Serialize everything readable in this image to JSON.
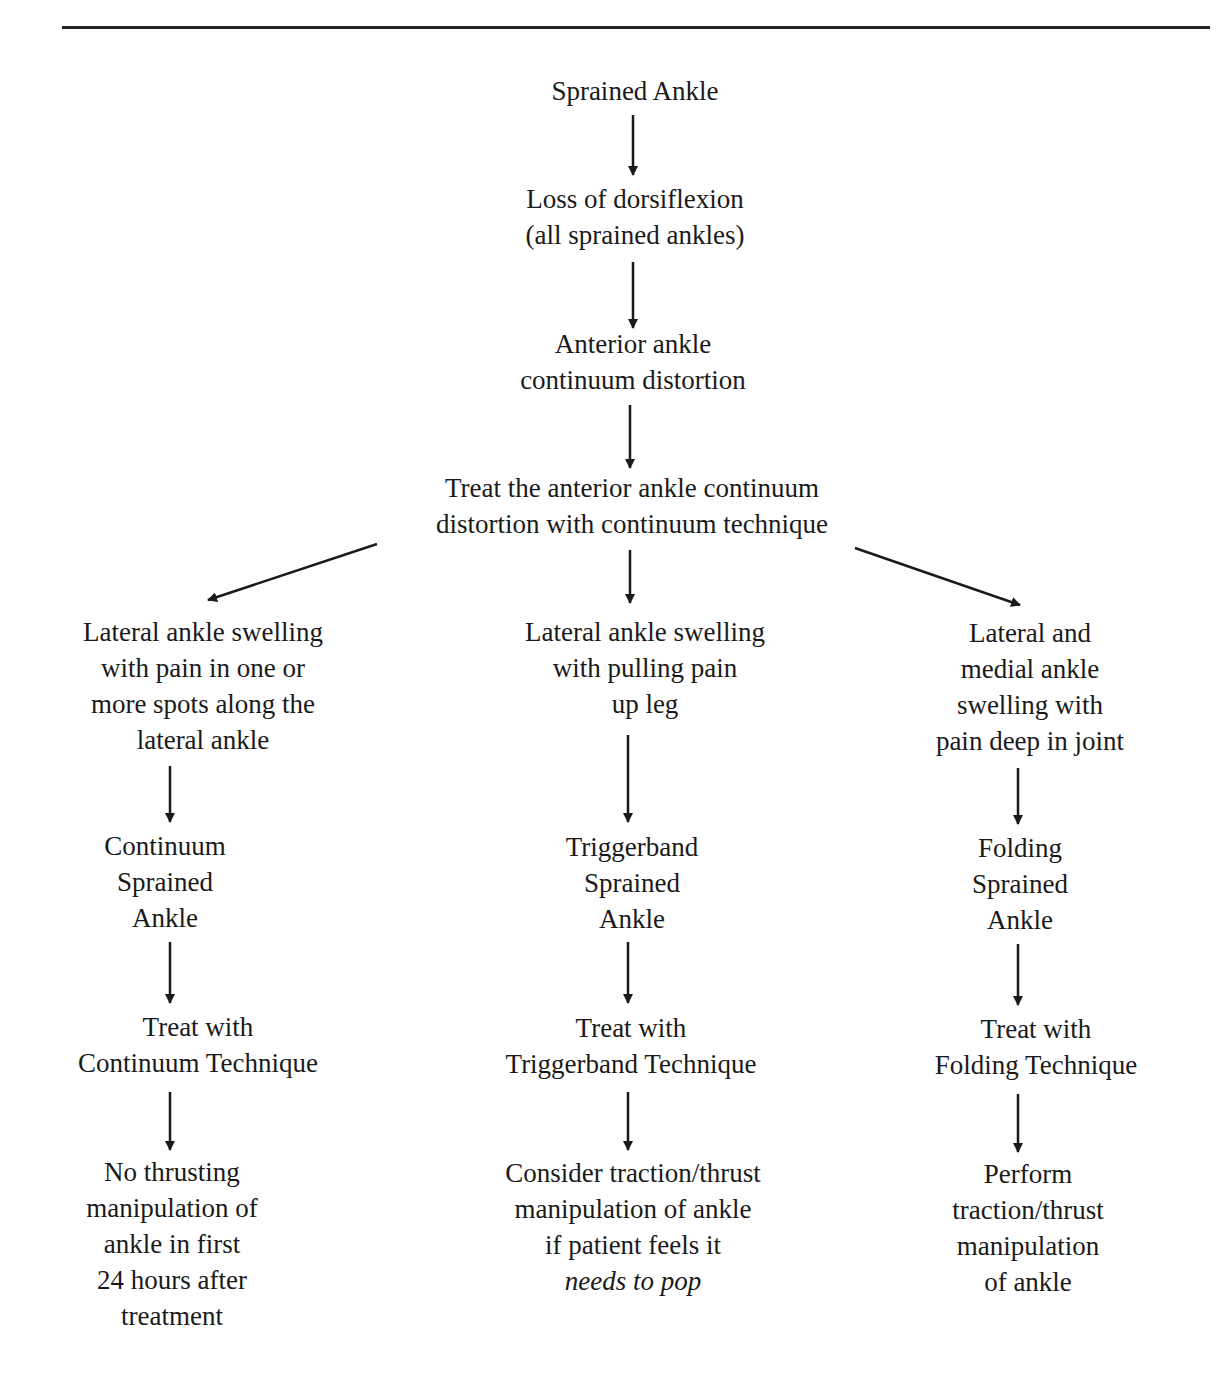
{
  "diagram": {
    "type": "flowchart",
    "root": {
      "lines": [
        "Sprained Ankle"
      ]
    },
    "step2": {
      "lines": [
        "Loss of dorsiflexion",
        "(all sprained ankles)"
      ]
    },
    "step3": {
      "lines": [
        "Anterior ankle",
        "continuum distortion"
      ]
    },
    "step4": {
      "lines": [
        "Treat the anterior ankle continuum",
        "distortion with continuum technique"
      ]
    },
    "branches": [
      {
        "symptom": {
          "lines": [
            "Lateral ankle swelling",
            "with pain in one or",
            "more spots along the",
            "lateral ankle"
          ]
        },
        "diagnosis": {
          "lines": [
            "Continuum",
            "Sprained",
            "Ankle"
          ]
        },
        "treatment": {
          "lines": [
            "Treat with",
            "Continuum Technique"
          ]
        },
        "outcome": {
          "lines": [
            "No thrusting",
            "manipulation of",
            "ankle in first",
            "24 hours after",
            "treatment"
          ]
        }
      },
      {
        "symptom": {
          "lines": [
            "Lateral ankle swelling",
            "with pulling pain",
            "up leg"
          ]
        },
        "diagnosis": {
          "lines": [
            "Triggerband",
            "Sprained",
            "Ankle"
          ]
        },
        "treatment": {
          "lines": [
            "Treat with",
            "Triggerband Technique"
          ]
        },
        "outcome": {
          "lines": [
            "Consider traction/thrust",
            "manipulation of ankle",
            "if patient feels it",
            "needs to pop"
          ]
        }
      },
      {
        "symptom": {
          "lines": [
            "Lateral and",
            "medial ankle",
            "swelling with",
            "pain deep in joint"
          ]
        },
        "diagnosis": {
          "lines": [
            "Folding",
            "Sprained",
            "Ankle"
          ]
        },
        "treatment": {
          "lines": [
            "Treat with",
            "Folding Technique"
          ]
        },
        "outcome": {
          "lines": [
            "Perform",
            "traction/thrust",
            "manipulation",
            "of ankle"
          ]
        }
      }
    ]
  }
}
